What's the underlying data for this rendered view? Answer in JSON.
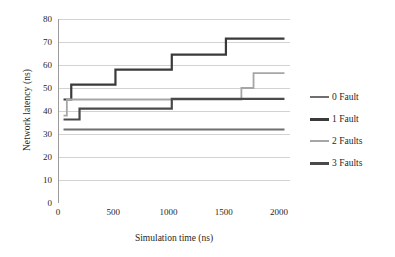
{
  "chart_data": {
    "type": "line",
    "title": "",
    "xlabel": "Simulation time (ns)",
    "ylabel": "Network latency (ns)",
    "xlim": [
      0,
      2100
    ],
    "ylim": [
      0,
      80
    ],
    "xticks": [
      0,
      500,
      1000,
      1500,
      2000
    ],
    "yticks": [
      0,
      10,
      20,
      30,
      40,
      50,
      60,
      70,
      80
    ],
    "grid": "horizontal",
    "legend_position": "right",
    "step_style": "post",
    "series": [
      {
        "name": "0 Fault",
        "color": "#6f6f6f",
        "width": 2.0,
        "x": [
          50,
          2050
        ],
        "y": [
          32,
          32
        ]
      },
      {
        "name": "1 Fault",
        "color": "#3a3a3a",
        "width": 2.2,
        "x": [
          50,
          120,
          120,
          520,
          520,
          1030,
          1030,
          1520,
          1520,
          2050
        ],
        "y": [
          45,
          45,
          51.5,
          51.5,
          58,
          58,
          64.5,
          64.5,
          71.5,
          71.5
        ]
      },
      {
        "name": "2 Faults",
        "color": "#a6a6a6",
        "width": 1.8,
        "x": [
          50,
          80,
          80,
          1660,
          1660,
          1770,
          1770,
          2050
        ],
        "y": [
          38,
          38,
          45,
          45,
          50,
          50,
          56.5,
          56.5
        ]
      },
      {
        "name": "3 Faults",
        "color": "#4a4a4a",
        "width": 2.2,
        "x": [
          50,
          195,
          195,
          1030,
          1030,
          2050
        ],
        "y": [
          36.3,
          36.3,
          41,
          41,
          45.3,
          45.3
        ]
      }
    ]
  },
  "axes": {
    "x_tick_labels": [
      "0",
      "500",
      "1000",
      "1500",
      "2000"
    ],
    "y_tick_labels": [
      "0",
      "10",
      "20",
      "30",
      "40",
      "50",
      "60",
      "70",
      "80"
    ],
    "x_axis_title": "Simulation time (ns)",
    "y_axis_title": "Network latency (ns)"
  },
  "legend": {
    "items": [
      {
        "label": "0 Fault",
        "color": "#6f6f6f",
        "thickness": "2px"
      },
      {
        "label": "1 Fault",
        "color": "#3a3a3a",
        "thickness": "3px"
      },
      {
        "label": "2 Faults",
        "color": "#a6a6a6",
        "thickness": "2px"
      },
      {
        "label": "3 Faults",
        "color": "#4a4a4a",
        "thickness": "3px"
      }
    ]
  },
  "style": {
    "grid_color": "#d2d2d2",
    "axis_color": "#9a9a9a",
    "background": "#ffffff"
  }
}
